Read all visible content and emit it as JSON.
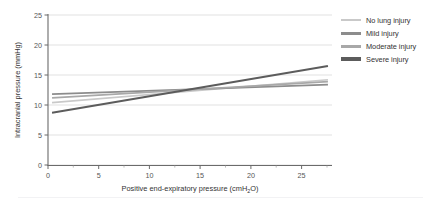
{
  "chart_data": {
    "type": "line",
    "title": "",
    "xlabel": "Positive end-expiratory pressure (cmH₂O)",
    "xlabel_main": "Positive end-expiratory pressure (cmH",
    "xlabel_sub": "2",
    "xlabel_tail": "O)",
    "ylabel": "Intracranial pressure (mmHg)",
    "xlim": [
      0,
      28
    ],
    "ylim": [
      0,
      25
    ],
    "xticks": [
      0,
      5,
      10,
      15,
      20,
      25
    ],
    "yticks": [
      0,
      5,
      10,
      15,
      20,
      25
    ],
    "xtick_labels": [
      "0",
      "5",
      "10",
      "15",
      "20",
      "25"
    ],
    "ytick_labels": [
      "0",
      "5",
      "10",
      "15",
      "20",
      "25"
    ],
    "grid": "horizontal",
    "legend_position": "right",
    "series": [
      {
        "name": "No lung injury",
        "color": "#c9c9c9",
        "width": 1.6,
        "x": [
          0.4,
          27.6
        ],
        "y": [
          10.4,
          14.2
        ]
      },
      {
        "name": "Mild injury",
        "color": "#8c8c8c",
        "width": 1.8,
        "x": [
          0.4,
          27.6
        ],
        "y": [
          11.8,
          13.4
        ]
      },
      {
        "name": "Moderate injury",
        "color": "#a8a8a8",
        "width": 1.8,
        "x": [
          0.4,
          27.6
        ],
        "y": [
          11.2,
          13.9
        ]
      },
      {
        "name": "Severe injury",
        "color": "#5c5c5c",
        "width": 2.0,
        "x": [
          0.4,
          27.6
        ],
        "y": [
          8.7,
          16.5
        ]
      }
    ]
  },
  "legend": {
    "items": [
      {
        "label": "No lung injury",
        "color": "#c9c9c9",
        "thickness": "2px"
      },
      {
        "label": "Mild injury",
        "color": "#8c8c8c",
        "thickness": "3px"
      },
      {
        "label": "Moderate injury",
        "color": "#a8a8a8",
        "thickness": "3px"
      },
      {
        "label": "Severe injury",
        "color": "#5c5c5c",
        "thickness": "3.4px"
      }
    ]
  },
  "axes": {
    "x_title_main": "Positive end-expiratory pressure (cmH",
    "x_title_sub": "2",
    "x_title_tail": "O)",
    "y_title": "Intracranial pressure (mmHg)",
    "grid_color": "#d9d9d9",
    "axis_color": "#6b6b6b",
    "tick_color": "#8a8a8a"
  }
}
